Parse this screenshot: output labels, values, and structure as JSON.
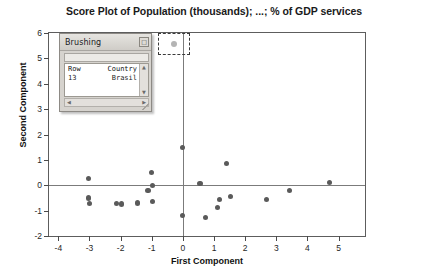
{
  "chart_data": {
    "type": "scatter",
    "title": "Score Plot of Population (thousands); ...; % of GDP services",
    "xlabel": "First Component",
    "ylabel": "Second Component",
    "xlim": [
      -4.3,
      5.85
    ],
    "ylim": [
      -2,
      6
    ],
    "xticks": [
      "-4",
      "-3",
      "-2",
      "-1",
      "0",
      "1",
      "2",
      "3",
      "4",
      "5"
    ],
    "xtick_values": [
      -4,
      -3,
      -2,
      -1,
      0,
      1,
      2,
      3,
      4,
      5
    ],
    "yticks": [
      "6",
      "5",
      "4",
      "3",
      "2",
      "1",
      "0",
      "-1",
      "-2"
    ],
    "ytick_values": [
      6,
      5,
      4,
      3,
      2,
      1,
      0,
      -1,
      -2
    ],
    "grid": false,
    "legend": "none",
    "reference_lines": {
      "horizontal": 0,
      "vertical": 0
    },
    "marker_color": "#5a5a5a",
    "points": [
      {
        "x": -3.02,
        "y": 0.28
      },
      {
        "x": -3.02,
        "y": -0.5
      },
      {
        "x": -3.0,
        "y": -0.72
      },
      {
        "x": -2.12,
        "y": -0.73
      },
      {
        "x": -1.98,
        "y": -0.74
      },
      {
        "x": -1.45,
        "y": -0.7
      },
      {
        "x": -1.12,
        "y": -0.22
      },
      {
        "x": -1.0,
        "y": 0.5
      },
      {
        "x": -0.98,
        "y": -0.02
      },
      {
        "x": -0.97,
        "y": -0.63
      },
      {
        "x": 0.0,
        "y": 1.48
      },
      {
        "x": 0.0,
        "y": -1.2
      },
      {
        "x": 0.55,
        "y": 0.08
      },
      {
        "x": 0.72,
        "y": -1.28
      },
      {
        "x": 1.1,
        "y": -0.88
      },
      {
        "x": 1.18,
        "y": -0.55
      },
      {
        "x": 1.4,
        "y": 0.85
      },
      {
        "x": 1.52,
        "y": -0.45
      },
      {
        "x": 2.68,
        "y": -0.55
      },
      {
        "x": 3.42,
        "y": -0.22
      },
      {
        "x": 4.72,
        "y": 0.12
      }
    ]
  },
  "selection": {
    "label": "brush-selection-rectangle",
    "brushed_point_color": "#b4b4b4"
  },
  "brushing_window": {
    "title": "Brushing",
    "close_glyph": "□",
    "scroll_up_glyph": "▲",
    "scroll_down_glyph": "▼",
    "scroll_left_glyph": "◀",
    "scroll_right_glyph": "▶",
    "columns": [
      "Row",
      "Country"
    ],
    "rows": [
      {
        "row": "13",
        "country": "Brasil"
      }
    ]
  }
}
